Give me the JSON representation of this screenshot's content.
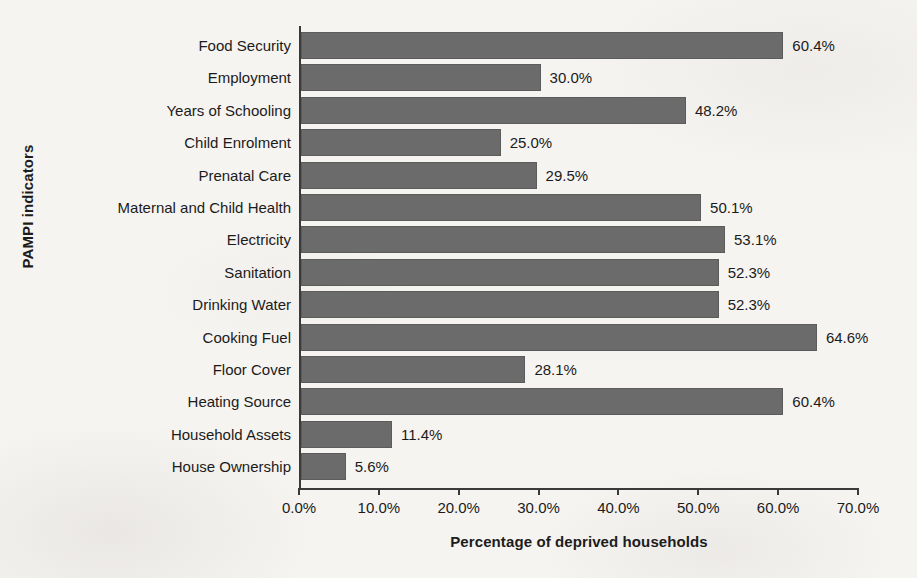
{
  "chart_data": {
    "type": "bar",
    "orientation": "horizontal",
    "title": "",
    "xlabel": "Percentage of deprived households",
    "ylabel": "PAMPI indicators",
    "xlim": [
      0,
      70
    ],
    "grid": false,
    "legend": null,
    "value_suffix": "%",
    "categories": [
      "Food Security",
      "Employment",
      "Years of Schooling",
      "Child Enrolment",
      "Prenatal Care",
      "Maternal and Child Health",
      "Electricity",
      "Sanitation",
      "Drinking Water",
      "Cooking Fuel",
      "Floor Cover",
      "Heating Source",
      "Household Assets",
      "House Ownership"
    ],
    "values": [
      60.4,
      30.0,
      48.2,
      25.0,
      29.5,
      50.1,
      53.1,
      52.3,
      52.3,
      64.6,
      28.1,
      60.4,
      11.4,
      5.6
    ],
    "value_labels": [
      "60.4%",
      "30.0%",
      "48.2%",
      "25.0%",
      "29.5%",
      "50.1%",
      "53.1%",
      "52.3%",
      "52.3%",
      "64.6%",
      "28.1%",
      "60.4%",
      "11.4%",
      "5.6%"
    ],
    "xticks": [
      0,
      10,
      20,
      30,
      40,
      50,
      60,
      70
    ],
    "xticklabels": [
      "0.0%",
      "10.0%",
      "20.0%",
      "30.0%",
      "40.0%",
      "50.0%",
      "60.0%",
      "70.0%"
    ],
    "bar_color": "#6b6b6b",
    "axis_color": "#3a3a3a",
    "background_color": "#f6f4f1",
    "text_color": "#1b1b1b"
  }
}
